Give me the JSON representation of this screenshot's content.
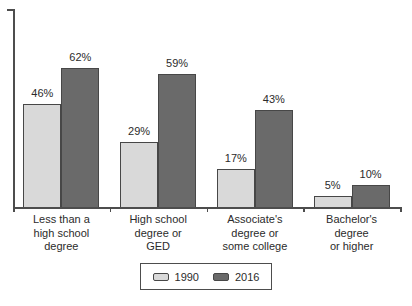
{
  "chart_data": {
    "type": "bar",
    "categories": [
      "Less than a\nhigh school\ndegree",
      "High school\ndegree or\nGED",
      "Associate's\ndegree or\nsome college",
      "Bachelor's\ndegree\nor higher"
    ],
    "series": [
      {
        "name": "1990",
        "color": "#d9d9d9",
        "values": [
          46,
          29,
          17,
          5
        ]
      },
      {
        "name": "2016",
        "color": "#6a6a6a",
        "values": [
          62,
          59,
          43,
          10
        ]
      }
    ],
    "value_suffix": "%",
    "data_labels": {
      "1990": [
        "46%",
        "29%",
        "17%",
        "5%"
      ],
      "2016": [
        "62%",
        "59%",
        "43%",
        "10%"
      ]
    },
    "title": "",
    "xlabel": "",
    "ylabel": "",
    "ylim": [
      0,
      70
    ],
    "grid": false,
    "legend_position": "bottom-center"
  },
  "colors": {
    "background": "#ffffff",
    "axis": "#4d4d4d",
    "bar_border": "#474747",
    "text": "#2b2b2b",
    "series_1990": "#d9d9d9",
    "series_2016": "#6a6a6a",
    "legend_border": "#4d4d4d"
  }
}
